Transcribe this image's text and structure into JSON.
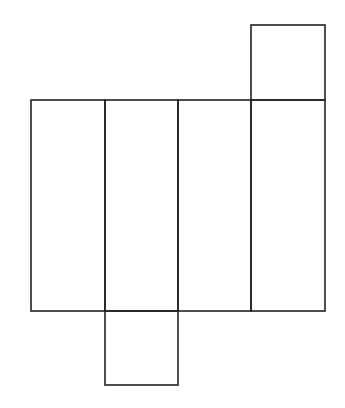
{
  "diagram": {
    "type": "cuboid-net",
    "stroke_color": "#222222",
    "background_color": "#ffffff",
    "faces": [
      {
        "id": "side-1",
        "x": 31,
        "y": 100,
        "width": 74,
        "height": 211
      },
      {
        "id": "side-2",
        "x": 105,
        "y": 100,
        "width": 73,
        "height": 211
      },
      {
        "id": "side-3",
        "x": 178,
        "y": 100,
        "width": 73,
        "height": 211
      },
      {
        "id": "side-4",
        "x": 251,
        "y": 100,
        "width": 74,
        "height": 211
      },
      {
        "id": "top-square",
        "x": 251,
        "y": 25,
        "width": 74,
        "height": 75
      },
      {
        "id": "bottom-square",
        "x": 105,
        "y": 311,
        "width": 73,
        "height": 74
      }
    ]
  }
}
